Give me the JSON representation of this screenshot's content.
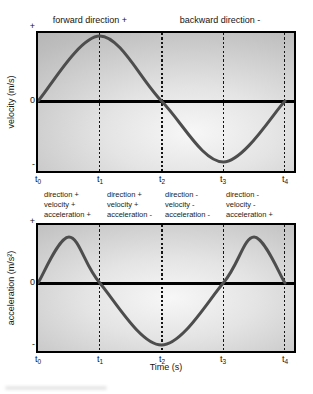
{
  "colors": {
    "curve": "#4d4d4d",
    "axis": "#000000",
    "gridline": "#141414",
    "plot_bg_center": "#f7f7f7",
    "plot_bg_edge": "#a9a9a9"
  },
  "header": {
    "forward_label": "forward direction +",
    "backward_label": "backward direction -"
  },
  "velocity_plot": {
    "ylabel": "velocity (m/s)",
    "y_plus": "+",
    "y_zero": "0",
    "y_minus": "-"
  },
  "acceleration_plot": {
    "ylabel": "acceleration (m/s²)",
    "y_plus": "+",
    "y_zero": "0",
    "y_minus": "-"
  },
  "time_axis": {
    "label": "Time (s)",
    "ticks": [
      {
        "base": "t",
        "sub": "0"
      },
      {
        "base": "t",
        "sub": "1"
      },
      {
        "base": "t",
        "sub": "2"
      },
      {
        "base": "t",
        "sub": "3"
      },
      {
        "base": "t",
        "sub": "4"
      }
    ]
  },
  "annotations": [
    {
      "lines": [
        "direction +",
        "velocity +",
        "acceleration +"
      ]
    },
    {
      "lines": [
        "direction +",
        "velocity +",
        "acceleration -"
      ]
    },
    {
      "lines": [
        "direction -",
        "velocity -",
        "acceleration -"
      ]
    },
    {
      "lines": [
        "direction -",
        "velocity -",
        "acceleration +"
      ]
    }
  ],
  "chart_data": [
    {
      "type": "line",
      "title": "velocity vs time",
      "xlabel": "Time (s)",
      "ylabel": "velocity (m/s)",
      "x_tick_labels": [
        "t0",
        "t1",
        "t2",
        "t3",
        "t4"
      ],
      "y_tick_labels": [
        "+",
        "0",
        "-"
      ],
      "x": [
        0,
        1,
        2,
        3,
        4
      ],
      "values": [
        0,
        1,
        0,
        -1,
        0
      ],
      "xlim": [
        0,
        4
      ],
      "ylim": [
        -1,
        1
      ],
      "grid": "dashed vertical at t1 t2 t3 t4, t2 bold",
      "legend": "none",
      "note": "sine curve: zero at t0 t2 t4, maximum at t1, minimum at t3"
    },
    {
      "type": "line",
      "title": "acceleration vs time",
      "xlabel": "Time (s)",
      "ylabel": "acceleration (m/s2)",
      "x_tick_labels": [
        "t0",
        "t1",
        "t2",
        "t3",
        "t4"
      ],
      "y_tick_labels": [
        "+",
        "0",
        "-"
      ],
      "x": [
        0,
        0.5,
        1,
        2,
        3,
        3.5,
        4
      ],
      "values": [
        0,
        1,
        0,
        -1,
        0,
        1,
        0
      ],
      "xlim": [
        0,
        4
      ],
      "ylim": [
        -1,
        1
      ],
      "grid": "dashed vertical at t1 t2 t3 t4, t2 bold",
      "legend": "none",
      "note": "positive humps between t0-t1 and t3-t4, broad minimum at t2"
    }
  ]
}
